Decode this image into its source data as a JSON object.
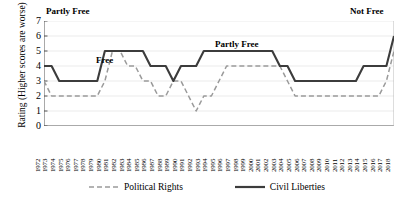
{
  "chart_data": {
    "type": "line",
    "title": "",
    "xlabel": "",
    "ylabel": "Rating (Higher scores are worse)",
    "ylim": [
      0,
      7
    ],
    "yticks": [
      7,
      6,
      5,
      4,
      3,
      2,
      1,
      0
    ],
    "grid": true,
    "legend_position": "bottom",
    "x": [
      1972,
      1973,
      1974,
      1975,
      1976,
      1977,
      1978,
      1979,
      1980,
      1981,
      1982,
      1983,
      1984,
      1985,
      1986,
      1987,
      1988,
      1989,
      1990,
      1991,
      1992,
      1993,
      1994,
      1995,
      1996,
      1997,
      1998,
      1999,
      2000,
      2001,
      2002,
      2003,
      2004,
      2005,
      2006,
      2007,
      2008,
      2009,
      2010,
      2011,
      2012,
      2013,
      2014,
      2015,
      2016,
      2017,
      2018
    ],
    "series": [
      {
        "name": "Political Rights",
        "style": "dashed",
        "color": "#9a9a9a",
        "values": [
          3,
          2,
          2,
          2,
          2,
          2,
          2,
          2,
          3,
          5,
          5,
          4,
          4,
          3,
          3,
          2,
          2,
          3,
          3,
          2,
          1,
          2,
          2,
          3,
          4,
          4,
          4,
          4,
          4,
          4,
          4,
          4,
          3,
          2,
          2,
          2,
          2,
          2,
          2,
          2,
          2,
          2,
          2,
          2,
          2,
          3,
          5
        ]
      },
      {
        "name": "Civil Liberties",
        "style": "solid",
        "color": "#3c3c3c",
        "values": [
          4,
          4,
          3,
          3,
          3,
          3,
          3,
          3,
          5,
          5,
          5,
          5,
          5,
          5,
          4,
          4,
          4,
          3,
          4,
          4,
          4,
          5,
          5,
          5,
          5,
          5,
          5,
          5,
          5,
          5,
          5,
          4,
          4,
          3,
          3,
          3,
          3,
          3,
          3,
          3,
          3,
          3,
          4,
          4,
          4,
          4,
          6
        ]
      }
    ],
    "annotations": [
      {
        "text": "Partly Free",
        "id": "partly-free-left"
      },
      {
        "text": "Not Free",
        "id": "not-free"
      },
      {
        "text": "Free",
        "id": "free"
      },
      {
        "text": "Partly Free",
        "id": "partly-free-mid"
      }
    ],
    "legend": [
      {
        "label": "Political Rights"
      },
      {
        "label": "Civil Liberties"
      }
    ]
  }
}
